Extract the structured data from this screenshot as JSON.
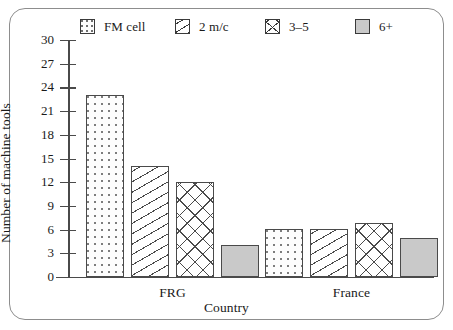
{
  "chart_data": {
    "type": "bar",
    "title": "",
    "xlabel": "Country",
    "ylabel": "Number of machine tools",
    "categories": [
      "FRG",
      "France"
    ],
    "series": [
      {
        "name": "FM cell",
        "pattern": "dotted",
        "values": [
          23,
          6.1
        ]
      },
      {
        "name": "2 m/c",
        "pattern": "diagonal",
        "values": [
          14,
          6.1
        ]
      },
      {
        "name": "3–5",
        "pattern": "cross-hatch",
        "values": [
          12,
          6.9
        ]
      },
      {
        "name": "6+",
        "pattern": "solid-gray",
        "values": [
          4.1,
          4.9
        ]
      }
    ],
    "ylim": [
      0,
      30
    ],
    "ytick_step": 3,
    "yticks": [
      30,
      27,
      24,
      21,
      18,
      15,
      12,
      9,
      6,
      3,
      0
    ],
    "ytick_labels": [
      "30",
      "27",
      "24",
      "21",
      "18",
      "15",
      "12",
      "9",
      "6",
      "3",
      "0"
    ],
    "grid": false,
    "legend_position": "top"
  },
  "legend": {
    "items": [
      {
        "label": "FM cell",
        "swatch": "dotted-swatch",
        "color": "#fdfdfd"
      },
      {
        "label": "2 m/c",
        "swatch": "diagonal-swatch",
        "color": "#ffffff"
      },
      {
        "label": "3–5",
        "swatch": "cross-hatch-swatch",
        "color": "#ffffff"
      },
      {
        "label": "6+",
        "swatch": "solid-gray-swatch",
        "color": "#c9c9c9"
      }
    ]
  },
  "axes": {
    "y_title": "Number of machine tools",
    "x_title": "Country",
    "group_labels": [
      "FRG",
      "France"
    ]
  },
  "colors": {
    "axis": "#4a4a4a",
    "frame": "#8d8d8d",
    "bar_outline": "#4a4a4a",
    "solid_fill": "#c9c9c9",
    "text": "#1a1a1a",
    "background": "#ffffff"
  }
}
